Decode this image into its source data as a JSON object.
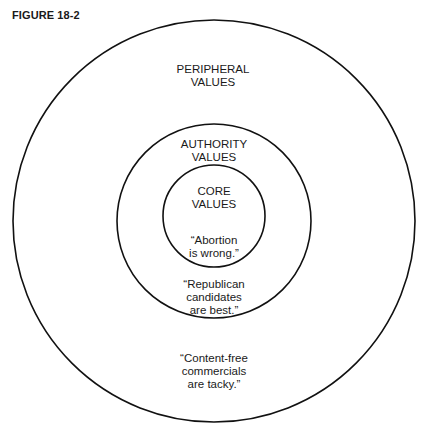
{
  "figure_label": "FIGURE 18-2",
  "circles": [
    {
      "name": "peripheral",
      "cx": 214,
      "cy": 221,
      "r": 201
    },
    {
      "name": "authority",
      "cx": 214,
      "cy": 221,
      "r": 97
    },
    {
      "name": "core",
      "cx": 214,
      "cy": 216,
      "r": 51
    }
  ],
  "labels": {
    "peripheral_title": "PERIPHERAL\nVALUES",
    "authority_title": "AUTHORITY\nVALUES",
    "core_title": "CORE\nVALUES",
    "core_example": "“Abortion\nis wrong.”",
    "authority_example": "“Republican\ncandidates\nare best.”",
    "peripheral_example": "“Content-free\ncommercials\nare tacky.”"
  },
  "colors": {
    "stroke": "#111111",
    "background": "#ffffff"
  }
}
